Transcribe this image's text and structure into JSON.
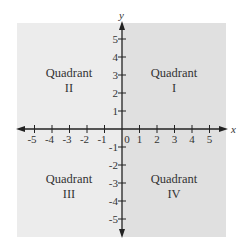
{
  "diagram": {
    "axes": {
      "x_label": "x",
      "y_label": "y",
      "x_ticks": [
        "-5",
        "-4",
        "-3",
        "-2",
        "-1",
        "0",
        "1",
        "2",
        "3",
        "4",
        "5"
      ],
      "y_ticks_positive": [
        "5",
        "4",
        "3",
        "2",
        "1"
      ],
      "y_ticks_negative": [
        "-1",
        "-2",
        "-3",
        "-4",
        "-5"
      ]
    },
    "quadrants": [
      {
        "id": "I",
        "line1": "Quadrant",
        "line2": "I"
      },
      {
        "id": "II",
        "line1": "Quadrant",
        "line2": "II"
      },
      {
        "id": "III",
        "line1": "Quadrant",
        "line2": "III"
      },
      {
        "id": "IV",
        "line1": "Quadrant",
        "line2": "IV"
      }
    ],
    "colors": {
      "right_half": "#e0e0e0",
      "left_half": "#ececec",
      "axis": "#222222",
      "text": "#333333"
    }
  }
}
